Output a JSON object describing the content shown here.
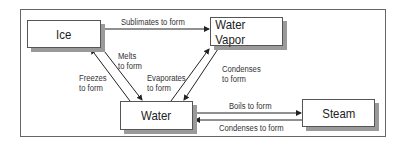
{
  "nodes": {
    "ice": "Ice",
    "water_vapor": "Water Vapor",
    "water": "Water",
    "steam": "Steam"
  },
  "edges": {
    "sublimates": "Sublimates to form",
    "melts_line1": "Melts",
    "melts_line2": "to form",
    "freezes_line1": "Freezes",
    "freezes_line2": "to form",
    "evaporates_line1": "Evaporates",
    "evaporates_line2": "to form",
    "condenses_vapor_line1": "Condenses",
    "condenses_vapor_line2": "to form",
    "boils": "Boils to form",
    "condenses_steam": "Condenses to form"
  }
}
